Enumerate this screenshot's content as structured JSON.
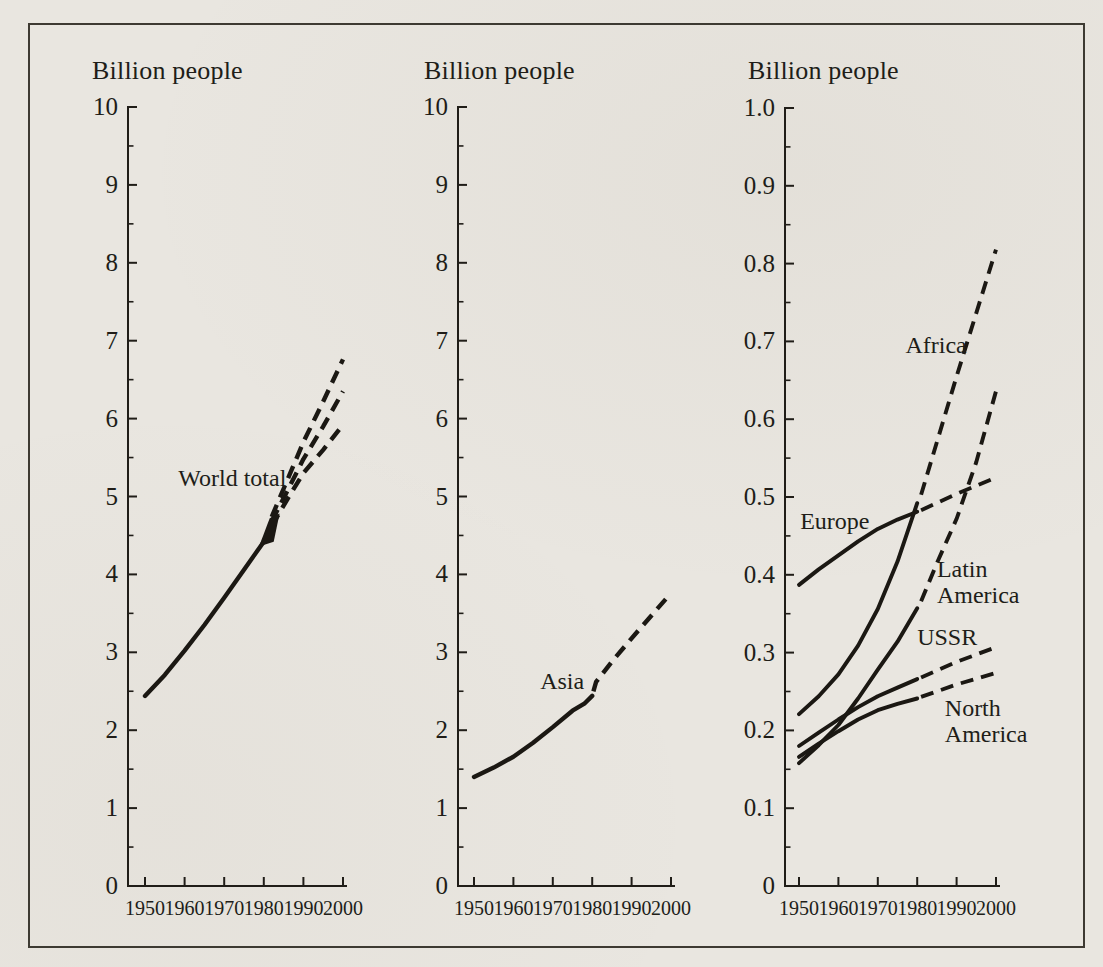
{
  "page": {
    "background_color": "#e9e6e0",
    "frame_color": "#2f2b23",
    "ink_color": "#201d18",
    "line_color": "#1b1813",
    "kind": "scanned population projection figure, three panels"
  },
  "chart_data": [
    {
      "id": "world-total",
      "type": "line",
      "title": "Billion people",
      "x_axis": {
        "min": 1950,
        "max": 2000,
        "tick_step": 10,
        "tick_labels": [
          "1950",
          "1960",
          "1970",
          "1980",
          "1990",
          "2000"
        ]
      },
      "y_axis": {
        "min": 0,
        "max": 10,
        "minor_step": 0.5,
        "ticks": [
          {
            "v": 0,
            "label": "0"
          },
          {
            "v": 1,
            "label": "1"
          },
          {
            "v": 2,
            "label": "2"
          },
          {
            "v": 3,
            "label": "3"
          },
          {
            "v": 4,
            "label": "4"
          },
          {
            "v": 5,
            "label": "5"
          },
          {
            "v": 6,
            "label": "6"
          },
          {
            "v": 7,
            "label": "7"
          },
          {
            "v": 8,
            "label": "8"
          },
          {
            "v": 9,
            "label": "9"
          },
          {
            "v": 10,
            "label": "10"
          }
        ]
      },
      "series": [
        {
          "name": "World total",
          "solid": [
            [
              1950,
              2.44
            ],
            [
              1955,
              2.71
            ],
            [
              1960,
              3.02
            ],
            [
              1965,
              3.35
            ],
            [
              1970,
              3.7
            ],
            [
              1975,
              4.06
            ],
            [
              1980,
              4.42
            ]
          ],
          "dashed": [
            [
              [
                1982,
                4.74
              ],
              [
                1986,
                5.22
              ],
              [
                1990,
                5.7
              ],
              [
                1995,
                6.22
              ],
              [
                2000,
                6.76
              ]
            ],
            [
              [
                1982,
                4.68
              ],
              [
                1986,
                5.08
              ],
              [
                1990,
                5.48
              ],
              [
                1995,
                5.9
              ],
              [
                2000,
                6.35
              ]
            ],
            [
              [
                1982,
                4.62
              ],
              [
                1986,
                4.97
              ],
              [
                1990,
                5.3
              ],
              [
                1995,
                5.6
              ],
              [
                2000,
                5.92
              ]
            ]
          ],
          "wedge": [
            [
              1978.8,
              4.36
            ],
            [
              1981.5,
              4.72
            ],
            [
              1984,
              4.78
            ],
            [
              1982.5,
              4.42
            ]
          ]
        }
      ],
      "annotations": [
        {
          "text": "World total",
          "x": 1958.4,
          "y": 5.24
        }
      ]
    },
    {
      "id": "asia",
      "type": "line",
      "title": "Billion people",
      "x_axis": {
        "min": 1950,
        "max": 2000,
        "tick_step": 10,
        "tick_labels": [
          "1950",
          "1960",
          "1970",
          "1980",
          "1990",
          "2000"
        ]
      },
      "y_axis": {
        "min": 0,
        "max": 10,
        "minor_step": 0.5,
        "ticks": [
          {
            "v": 0,
            "label": "0"
          },
          {
            "v": 1,
            "label": "1"
          },
          {
            "v": 2,
            "label": "2"
          },
          {
            "v": 3,
            "label": "3"
          },
          {
            "v": 4,
            "label": "4"
          },
          {
            "v": 5,
            "label": "5"
          },
          {
            "v": 6,
            "label": "6"
          },
          {
            "v": 7,
            "label": "7"
          },
          {
            "v": 8,
            "label": "8"
          },
          {
            "v": 9,
            "label": "9"
          },
          {
            "v": 10,
            "label": "10"
          }
        ]
      },
      "series": [
        {
          "name": "Asia",
          "solid": [
            [
              1950,
              1.4
            ],
            [
              1955,
              1.52
            ],
            [
              1960,
              1.66
            ],
            [
              1965,
              1.84
            ],
            [
              1970,
              2.04
            ],
            [
              1975,
              2.25
            ],
            [
              1978,
              2.34
            ],
            [
              1980,
              2.44
            ]
          ],
          "dashed": [
            [
              [
                1980.3,
                2.5
              ],
              [
                1981,
                2.62
              ],
              [
                1985,
                2.88
              ],
              [
                1990,
                3.18
              ],
              [
                1995,
                3.47
              ],
              [
                2000,
                3.76
              ]
            ]
          ]
        }
      ],
      "annotations": [
        {
          "text": "Asia",
          "x": 1966.8,
          "y": 2.63
        }
      ]
    },
    {
      "id": "regions",
      "type": "line",
      "title": "Billion people",
      "x_axis": {
        "min": 1950,
        "max": 2000,
        "tick_step": 10,
        "tick_labels": [
          "1950",
          "1960",
          "1970",
          "1980",
          "1990",
          "2000"
        ]
      },
      "y_axis": {
        "min": 0,
        "max": 1.0,
        "minor_step": 0.05,
        "ticks": [
          {
            "v": 0,
            "label": "0"
          },
          {
            "v": 0.1,
            "label": "0.1"
          },
          {
            "v": 0.2,
            "label": "0.2"
          },
          {
            "v": 0.3,
            "label": "0.3"
          },
          {
            "v": 0.4,
            "label": "0.4"
          },
          {
            "v": 0.5,
            "label": "0.5"
          },
          {
            "v": 0.6,
            "label": "0.6"
          },
          {
            "v": 0.7,
            "label": "0.7"
          },
          {
            "v": 0.8,
            "label": "0.8"
          },
          {
            "v": 0.9,
            "label": "0.9"
          },
          {
            "v": 1.0,
            "label": "1.0"
          }
        ]
      },
      "series": [
        {
          "name": "Africa",
          "solid": [
            [
              1950,
              0.221
            ],
            [
              1955,
              0.244
            ],
            [
              1960,
              0.272
            ],
            [
              1965,
              0.309
            ],
            [
              1970,
              0.356
            ],
            [
              1975,
              0.417
            ],
            [
              1980,
              0.492
            ]
          ],
          "dashed": [
            [
              [
                1981,
                0.503
              ],
              [
                1990,
                0.655
              ],
              [
                2000,
                0.818
              ]
            ]
          ]
        },
        {
          "name": "Europe",
          "solid": [
            [
              1950,
              0.387
            ],
            [
              1955,
              0.407
            ],
            [
              1960,
              0.425
            ],
            [
              1965,
              0.443
            ],
            [
              1970,
              0.459
            ],
            [
              1975,
              0.471
            ],
            [
              1980,
              0.481
            ]
          ],
          "dashed": [
            [
              [
                1981,
                0.483
              ],
              [
                1990,
                0.504
              ],
              [
                2000,
                0.525
              ]
            ]
          ]
        },
        {
          "name": "Latin America",
          "solid": [
            [
              1950,
              0.158
            ],
            [
              1955,
              0.181
            ],
            [
              1960,
              0.207
            ],
            [
              1965,
              0.241
            ],
            [
              1970,
              0.278
            ],
            [
              1975,
              0.314
            ],
            [
              1980,
              0.357
            ]
          ],
          "dashed": [
            [
              [
                1981,
                0.366
              ],
              [
                1985,
                0.415
              ],
              [
                1990,
                0.472
              ],
              [
                1995,
                0.545
              ],
              [
                2000,
                0.636
              ]
            ]
          ]
        },
        {
          "name": "USSR",
          "solid": [
            [
              1950,
              0.18
            ],
            [
              1955,
              0.197
            ],
            [
              1960,
              0.214
            ],
            [
              1965,
              0.23
            ],
            [
              1970,
              0.244
            ],
            [
              1975,
              0.255
            ],
            [
              1980,
              0.266
            ]
          ],
          "dashed": [
            [
              [
                1981,
                0.268
              ],
              [
                1990,
                0.288
              ],
              [
                2000,
                0.307
              ]
            ]
          ]
        },
        {
          "name": "North America",
          "solid": [
            [
              1950,
              0.166
            ],
            [
              1955,
              0.183
            ],
            [
              1960,
              0.199
            ],
            [
              1965,
              0.214
            ],
            [
              1970,
              0.226
            ],
            [
              1975,
              0.234
            ],
            [
              1980,
              0.241
            ]
          ],
          "dashed": [
            [
              [
                1981,
                0.243
              ],
              [
                1990,
                0.259
              ],
              [
                2000,
                0.274
              ]
            ]
          ]
        }
      ],
      "annotations": [
        {
          "text": "Africa",
          "x": 1977.0,
          "y": 0.695
        },
        {
          "text": "Europe",
          "x": 1950.3,
          "y": 0.469
        },
        {
          "lines": [
            "Latin",
            "America"
          ],
          "x": 1985.0,
          "y": 0.407
        },
        {
          "text": "USSR",
          "x": 1980.0,
          "y": 0.32
        },
        {
          "lines": [
            "North",
            "America"
          ],
          "x": 1987.0,
          "y": 0.229
        }
      ]
    }
  ]
}
